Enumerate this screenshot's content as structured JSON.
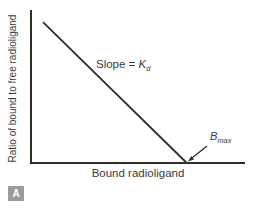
{
  "figure": {
    "panel_label": "A",
    "xlabel": "Bound radioligand",
    "ylabel": "Ratio of bound to free radioligand",
    "slope_annotation": {
      "prefix": "Slope = ",
      "symbol": "K",
      "subscript": "d"
    },
    "bmax_annotation": {
      "symbol": "B",
      "subscript": "max"
    }
  },
  "chart_data": {
    "type": "line",
    "title": "",
    "xlabel": "Bound radioligand",
    "ylabel": "Ratio of bound to free radioligand",
    "x_range": [
      0,
      1
    ],
    "y_range": [
      0,
      1
    ],
    "tick_labels": "none",
    "grid": false,
    "legend": "none",
    "series": [
      {
        "name": "ratio of bound to free vs bound (Scatchard line)",
        "x": [
          0.056,
          0.728
        ],
        "y": [
          0.92,
          0.0
        ]
      }
    ],
    "annotations": [
      {
        "text": "Slope = Kd",
        "position": "midpoint of line, above-right"
      },
      {
        "text": "Bmax",
        "position": "x-intercept of line",
        "arrow": true
      }
    ]
  }
}
